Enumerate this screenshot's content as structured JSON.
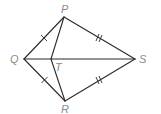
{
  "diagram": {
    "type": "kite with interior point",
    "points": {
      "P": {
        "label": "P",
        "x": 64,
        "y": 17
      },
      "Q": {
        "label": "Q",
        "x": 24,
        "y": 59
      },
      "R": {
        "label": "R",
        "x": 65,
        "y": 101
      },
      "S": {
        "label": "S",
        "x": 135,
        "y": 59
      },
      "T": {
        "label": "T",
        "x": 51,
        "y": 59
      }
    },
    "segments": [
      "PQ",
      "PS",
      "QR",
      "RS",
      "QS",
      "PT",
      "RT"
    ],
    "congruence_marks": {
      "single_tick": [
        "PQ",
        "QR"
      ],
      "double_tick": [
        "PS",
        "RS"
      ]
    },
    "colors": {
      "line": "#2a2a2a",
      "label": "#8a8a8a"
    }
  }
}
